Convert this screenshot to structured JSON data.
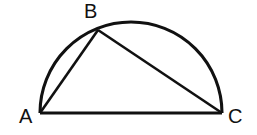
{
  "figure": {
    "background_color": "#ffffff",
    "stroke_color": "#111111",
    "labels": {
      "vertex_a": "A",
      "vertex_b": "B",
      "vertex_c": "C"
    },
    "geometry": {
      "point_a": {
        "x": 40,
        "y": 113
      },
      "point_b": {
        "x": 98,
        "y": 30
      },
      "point_c": {
        "x": 222,
        "y": 113
      },
      "center": {
        "x": 131,
        "y": 113
      },
      "radius": 91,
      "arc_path": "M 40 113 A 91 91 0 0 1 222 113",
      "diameter_path": "M 40 113 L 222 113",
      "chord_ab_path": "M 40 113 L 98 30",
      "chord_bc_path": "M 98 30 L 222 113"
    }
  }
}
